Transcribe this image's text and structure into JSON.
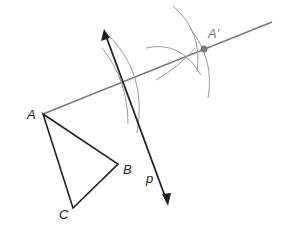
{
  "diagram": {
    "type": "geometric-construction",
    "colors": {
      "triangle": "#222222",
      "line_p": "#222222",
      "ray": "#7a7a7a",
      "arcs": "#9a9a9a",
      "image_point": "#7a7a7a"
    },
    "points": {
      "A": {
        "label": "A",
        "x": 43,
        "y": 114
      },
      "B": {
        "label": "B",
        "x": 118,
        "y": 164
      },
      "C": {
        "label": "C",
        "x": 73,
        "y": 208
      },
      "A_prime": {
        "label": "A′",
        "x": 204,
        "y": 49
      }
    },
    "line_p": {
      "label": "p",
      "x1": 104,
      "y1": 31,
      "x2": 168,
      "y2": 204
    },
    "ray_from_A": {
      "x1": 43,
      "y1": 114,
      "x2": 272,
      "y2": 22
    }
  }
}
